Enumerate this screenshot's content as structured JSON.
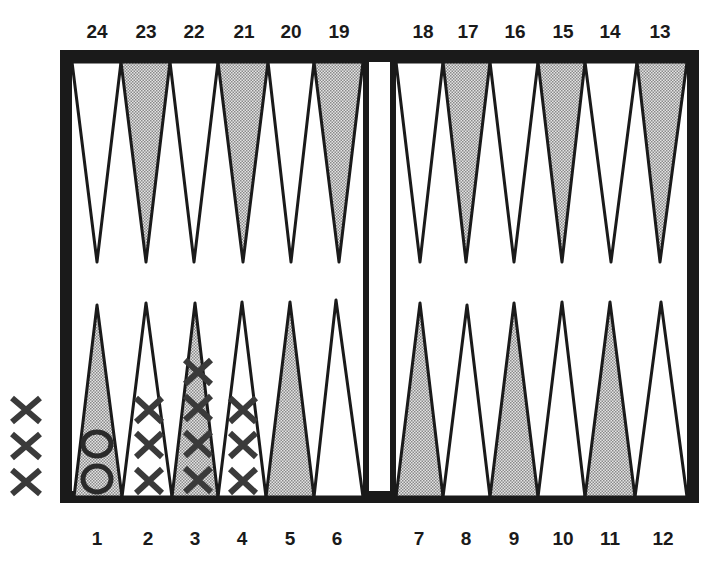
{
  "board": {
    "title": "Backgammon board diagram",
    "colors": {
      "frame": "#1a1a1a",
      "light_point": "#ffffff",
      "dark_point": "#b8b8b8",
      "ink": "#2a2a2a"
    },
    "top_labels": [
      "24",
      "23",
      "22",
      "21",
      "20",
      "19",
      "18",
      "17",
      "16",
      "15",
      "14",
      "13"
    ],
    "bottom_labels": [
      "1",
      "2",
      "3",
      "4",
      "5",
      "6",
      "7",
      "8",
      "9",
      "10",
      "11",
      "12"
    ],
    "checkers": [
      {
        "point": "1",
        "symbol": "O",
        "count": 2
      },
      {
        "point": "2",
        "symbol": "X",
        "count": 3
      },
      {
        "point": "3",
        "symbol": "X",
        "count": 4
      },
      {
        "point": "4",
        "symbol": "X",
        "count": 3
      }
    ],
    "off_board": {
      "symbol": "X",
      "count": 3,
      "side": "left"
    }
  }
}
